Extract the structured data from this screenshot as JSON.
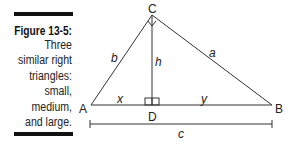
{
  "caption": {
    "figure_label": "Figure 13-5:",
    "lines": [
      "Three",
      "similar right",
      "triangles:",
      "small,",
      "medium,",
      "and large."
    ]
  },
  "diagram": {
    "vertices": {
      "A": "A",
      "B": "B",
      "C": "C",
      "D": "D"
    },
    "sides": {
      "a": "a",
      "b": "b",
      "c": "c",
      "h": "h",
      "x": "x",
      "y": "y"
    }
  }
}
